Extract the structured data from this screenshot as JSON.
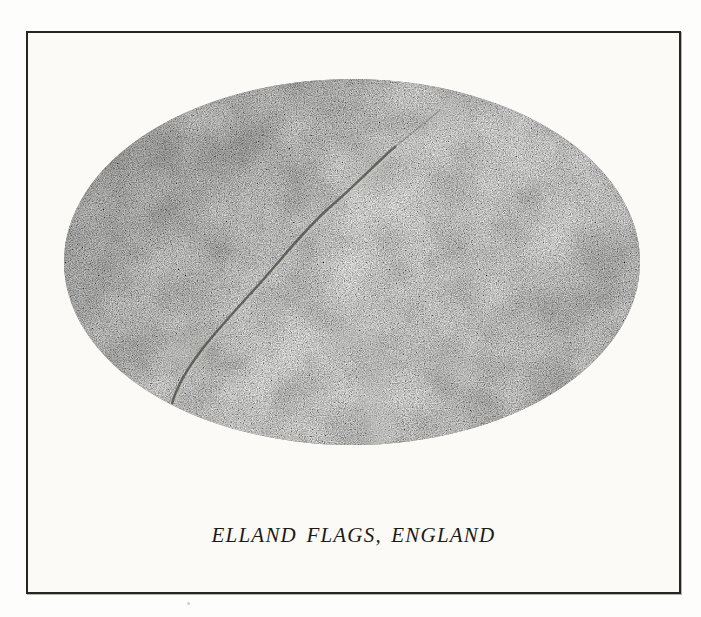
{
  "page": {
    "background": "#fdfdfb"
  },
  "plate": {
    "caption": "ELLAND FLAGS, ENGLAND",
    "photo_subject": "oval close-up photograph of gray speckled Elland Flags sandstone with a thin diagonal crack running from upper center to lower left",
    "colors": {
      "page_bg": "#fdfdfb",
      "frame_border": "#26251f",
      "plate_paper": "#fbfaf6",
      "stone_base": "#7c7c78",
      "stone_dark": "#565651",
      "stone_light": "#b5b5af",
      "caption_text": "#1b1b18"
    }
  }
}
